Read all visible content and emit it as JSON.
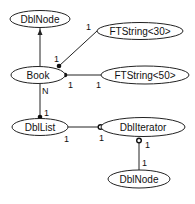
{
  "diagram": {
    "type": "object-relationship",
    "colors": {
      "line": "#222222",
      "fill": "#ffffff",
      "text": "#111111"
    },
    "nodes": [
      {
        "id": "dblnode_top",
        "label": "DblNode",
        "cx": 40,
        "cy": 19,
        "rx": 30,
        "ry": 8.5
      },
      {
        "id": "ftstring30",
        "label": "FTString<30>",
        "cx": 140,
        "cy": 31,
        "rx": 43,
        "ry": 8.5
      },
      {
        "id": "book",
        "label": "Book",
        "cx": 38,
        "cy": 75,
        "rx": 27,
        "ry": 8.5
      },
      {
        "id": "ftstring50",
        "label": "FTString<50>",
        "cx": 145,
        "cy": 75,
        "rx": 44,
        "ry": 9
      },
      {
        "id": "dbllist",
        "label": "DblList",
        "cx": 40,
        "cy": 127,
        "rx": 28,
        "ry": 8.5
      },
      {
        "id": "dbliterator",
        "label": "DblIterator",
        "cx": 143,
        "cy": 127,
        "rx": 42,
        "ry": 9.5
      },
      {
        "id": "dblnode_bottom",
        "label": "DblNode",
        "cx": 139,
        "cy": 179,
        "rx": 31,
        "ry": 9
      }
    ],
    "edges": [
      {
        "from": "book",
        "to": "dblnode_top",
        "kind": "inheritance-arrow"
      },
      {
        "from": "book",
        "to": "ftstring30",
        "kind": "filled-dot",
        "from_mult": "1",
        "to_mult": "1"
      },
      {
        "from": "book",
        "to": "ftstring50",
        "kind": "filled-dot",
        "from_mult": "1",
        "to_mult": "1"
      },
      {
        "from": "book",
        "to": "dbllist",
        "kind": "filled-dot",
        "from_mult": "N",
        "to_mult": "1"
      },
      {
        "from": "dbllist",
        "to": "dbliterator",
        "kind": "open-circle",
        "from_mult": "1",
        "to_mult": "1"
      },
      {
        "from": "dbliterator",
        "to": "dblnode_bottom",
        "kind": "open-circle",
        "from_mult": "1",
        "to_mult": "1"
      }
    ],
    "labels": {
      "dblnode_top": "DblNode",
      "ftstring30": "FTString<30>",
      "book": "Book",
      "ftstring50": "FTString<50>",
      "dbllist": "DblList",
      "dbliterator": "DblIterator",
      "dblnode_bottom": "DblNode",
      "m_book_ft30_near_book": "1",
      "m_book_ft30_near_ft": "1",
      "m_book_ft50_near_book": "1",
      "m_book_ft50_near_ft": "1",
      "m_book_list_N": "N",
      "m_book_list_1": "1",
      "m_list_iter_near_list": "1",
      "m_list_iter_near_iter": "1",
      "m_iter_node_near_iter": "1",
      "m_iter_node_near_node": "1"
    }
  }
}
